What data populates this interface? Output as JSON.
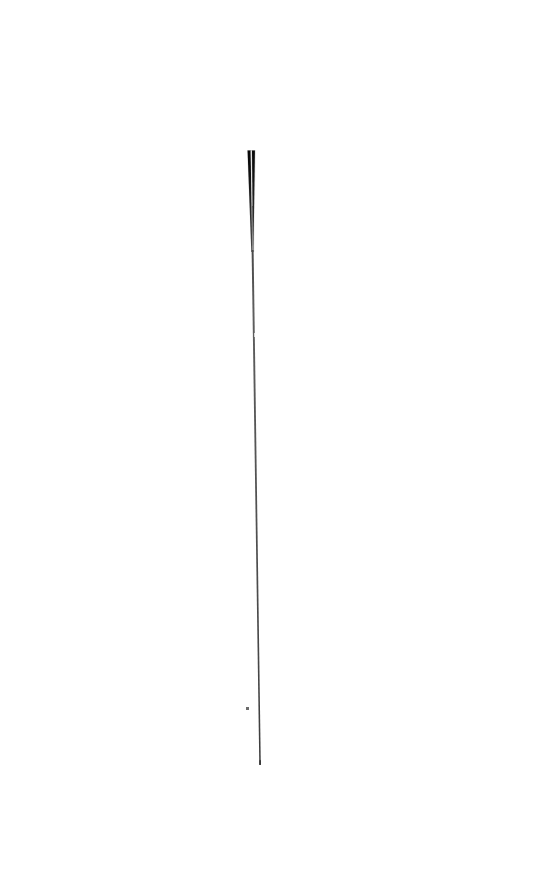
{
  "image": {
    "kind": "scanned-natural-image",
    "subject_label": "acupuncture needle",
    "caption": "",
    "width": 543,
    "height": 873,
    "background_color": "#ffffff",
    "orientation": "vertical",
    "notes": "Single elongated pin-like object photographed or scanned against a plain white field. No text, no axes, no UI chrome."
  },
  "palette": {
    "background": "#ffffff",
    "tip_core": "#0d0d0d",
    "tip_edge": "#2b2b2b",
    "shaft_dark": "#3c3c3c",
    "shaft_mid": "#5a5a5a",
    "shaft_light": "#8e8e8e",
    "speck": "#6b6b6b"
  },
  "object": {
    "name": "needle",
    "top_y": 150,
    "bottom_y": 765,
    "total_length_px": 615,
    "top_center_x": 251,
    "bottom_center_x": 260,
    "lean_px": 9,
    "handle": {
      "label": "thick dark tip / handle",
      "start_y": 150,
      "end_y": 252,
      "top_width_px": 7,
      "bottom_width_px": 2,
      "strands": 2,
      "strand_gap_px": 2
    },
    "shaft": {
      "label": "hairline shaft",
      "start_y": 252,
      "end_y": 765,
      "width_px": 1.4,
      "faint_break_y": 336
    }
  },
  "artifacts": [
    {
      "name": "dust-speck",
      "x": 247,
      "y": 708,
      "width": 3,
      "height": 3,
      "color": "#6b6b6b"
    }
  ]
}
